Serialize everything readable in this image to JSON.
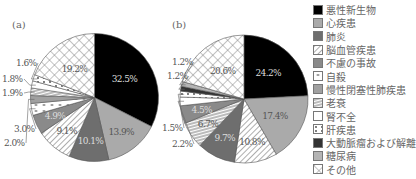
{
  "chart_data": [
    {
      "type": "pie",
      "title": "(a)",
      "start": "top",
      "direction": "clockwise",
      "slices": [
        {
          "category": "悪性新生物",
          "value": 32.5,
          "label": "32.5%"
        },
        {
          "category": "心疾患",
          "value": 13.9,
          "label": "13.9%"
        },
        {
          "category": "肺炎",
          "value": 10.1,
          "label": "10.1%"
        },
        {
          "category": "脳血管疾患",
          "value": 9.1,
          "label": "9.1%"
        },
        {
          "category": "不慮の事故",
          "value": 4.9,
          "label": "4.9%"
        },
        {
          "category": "自殺",
          "value": 3.0,
          "label": "3.0%"
        },
        {
          "category": "慢性閉塞性肺疾患",
          "value": 2.0,
          "label": "2.0%"
        },
        {
          "category": "老衰",
          "value": 1.9,
          "label": "1.9%"
        },
        {
          "category": "腎不全",
          "value": 1.8,
          "label": "1.8%"
        },
        {
          "category": "肝疾患",
          "value": 1.6,
          "label": "1.6%"
        },
        {
          "category": "その他",
          "value": 19.2,
          "label": "19.2%"
        }
      ]
    },
    {
      "type": "pie",
      "title": "(b)",
      "start": "top",
      "direction": "clockwise",
      "slices": [
        {
          "category": "悪性新生物",
          "value": 24.2,
          "label": "24.2%"
        },
        {
          "category": "心疾患",
          "value": 17.4,
          "label": "17.4%"
        },
        {
          "category": "脳血管疾患",
          "value": 10.8,
          "label": "10.8%"
        },
        {
          "category": "肺炎",
          "value": 9.7,
          "label": "9.7%"
        },
        {
          "category": "老衰",
          "value": 6.7,
          "label": "6.7%"
        },
        {
          "category": "不慮の事故",
          "value": 4.5,
          "label": "4.5%"
        },
        {
          "category": "腎不全",
          "value": 2.2,
          "label": "2.2%"
        },
        {
          "category": "肝疾患",
          "value": 1.5,
          "label": "1.5%"
        },
        {
          "category": "大動脈瘤および解離",
          "value": 1.2,
          "label": "1.2%"
        },
        {
          "category": "糖尿病",
          "value": 1.2,
          "label": "1.2%"
        },
        {
          "category": "その他",
          "value": 20.6,
          "label": "20.6%"
        }
      ]
    }
  ],
  "legend": {
    "placement": "right",
    "items": [
      {
        "label": "悪性新生物",
        "fill": "#000000",
        "pattern": "solid"
      },
      {
        "label": "心疾患",
        "fill": "#aaaaaa",
        "pattern": "solid"
      },
      {
        "label": "肺炎",
        "fill": "#6e6e6e",
        "pattern": "solid"
      },
      {
        "label": "脳血管疾患",
        "fill": "#ffffff",
        "pattern": "diagonal"
      },
      {
        "label": "不慮の事故",
        "fill": "#8a8a8a",
        "pattern": "solid"
      },
      {
        "label": "自殺",
        "fill": "#ffffff",
        "pattern": "blob"
      },
      {
        "label": "慢性閉塞性肺疾患",
        "fill": "#a0a0a0",
        "pattern": "solid"
      },
      {
        "label": "老衰",
        "fill": "#ffffff",
        "pattern": "horizontal"
      },
      {
        "label": "腎不全",
        "fill": "#ffffff",
        "pattern": "solid"
      },
      {
        "label": "肝疾患",
        "fill": "#ffffff",
        "pattern": "dots"
      },
      {
        "label": "大動脈瘤および解離",
        "fill": "#333333",
        "pattern": "solid"
      },
      {
        "label": "糖尿病",
        "fill": "#b4b4b4",
        "pattern": "solid"
      },
      {
        "label": "その他",
        "fill": "#ffffff",
        "pattern": "crosshatch"
      }
    ]
  }
}
